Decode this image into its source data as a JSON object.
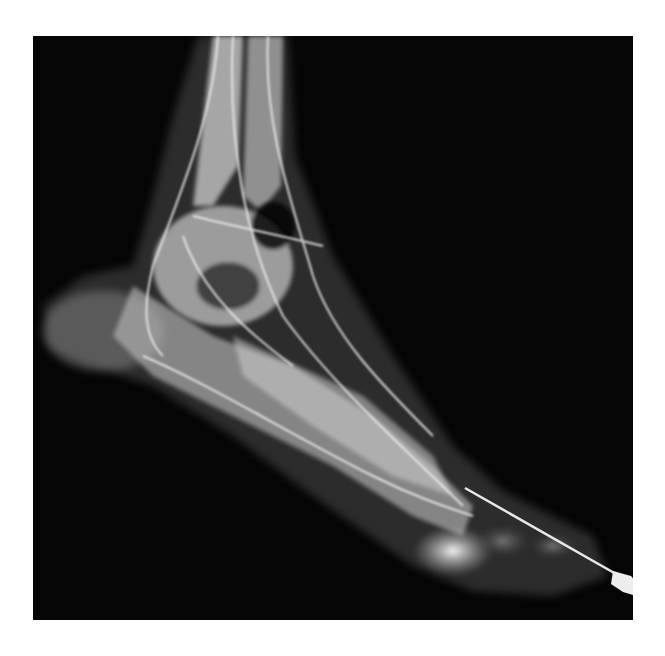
{
  "image": {
    "subject": "lateral foot and ankle radiograph with contrast-filled lymphatic vessels",
    "background_color": "#050505",
    "page_color": "#ffffff",
    "features": [
      "tibia-fibula",
      "talus",
      "calcaneus",
      "metatarsals",
      "toes",
      "lymphatic-vessels",
      "cannula-needle"
    ]
  }
}
